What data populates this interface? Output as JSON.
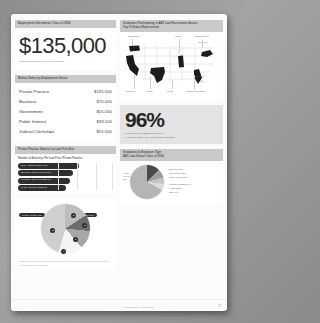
{
  "document": {
    "page_number": "17",
    "footer_text": "ABC Law School Annual Report"
  },
  "left_column": {
    "salary_panel": {
      "header": "Employment Information: Class of 2014",
      "big_figure": "$135,000",
      "big_figure_caption": "Median Starting Salary (Private Practice)"
    },
    "breakdown_panel": {
      "header": "Median Salary by Employment Sector",
      "rows": [
        {
          "label": "Private Practice",
          "value": "$135,000"
        },
        {
          "label": "Business",
          "value": "$70,000"
        },
        {
          "label": "Government",
          "value": "$55,000"
        },
        {
          "label": "Public Interest",
          "value": "$39,500"
        },
        {
          "label": "Judicial Clerkships",
          "value": "$55,000"
        }
      ]
    },
    "firm_size_panel": {
      "header": "Private Practice Salaries by Law Firm Size",
      "sub_caption": "Number of Attorneys Per Law Firm / Private Practice",
      "bars": [
        {
          "label": "501+ Attorneys  $160,000"
        },
        {
          "label": "251-500 Attorneys  $145,000"
        },
        {
          "label": "101-250 Attorneys  $125,000"
        },
        {
          "label": "2-100 Attorneys  $72,500"
        }
      ]
    },
    "pie_panel": {
      "legend": [
        {
          "label": "Private Practice  52%"
        },
        {
          "label": "Business  18%"
        },
        {
          "label": "Government  12%"
        }
      ],
      "slices": [
        {
          "name": "Private Practice",
          "value": 52,
          "marker": "52"
        },
        {
          "name": "Business",
          "value": 18,
          "marker": "18"
        },
        {
          "name": "Government",
          "value": 12,
          "marker": "12"
        },
        {
          "name": "Public Interest",
          "value": 11,
          "marker": "11"
        },
        {
          "name": "Clerkships",
          "value": 7,
          "marker": "7"
        }
      ],
      "footnote": "Employment status based on graduates reporting nine months after graduation. Percentages may not total 100% due to rounding."
    }
  },
  "right_column": {
    "map_panel": {
      "header_line1": "Graduates Participating in ABC Law Recruitment Across",
      "header_line2": "Top 10 States Represented",
      "callouts_top": [
        {
          "label": "Washington"
        },
        {
          "label": "Illinois"
        },
        {
          "label": "Massachusetts"
        },
        {
          "label": "New York"
        }
      ],
      "callouts_bottom": [
        {
          "label": "California"
        },
        {
          "label": "Arizona"
        },
        {
          "label": "Texas"
        },
        {
          "label": "District of Columbia"
        },
        {
          "label": "Georgia"
        },
        {
          "label": "Florida"
        }
      ]
    },
    "stat_panel": {
      "value": "96%",
      "caption_line1": "Percentage of Graduates Employed",
      "caption_line2": "or in further study, nine months after graduation"
    },
    "sector_pie_panel": {
      "header_line1": "Graduates by Employer Type",
      "header_line2": "ABC Law School Class of 2014",
      "side_label_line1": "Private",
      "side_label_line2": "Practice",
      "side_label_line3": "52%",
      "legend_group_1": [
        "Business  18%",
        "Government  12%",
        "Public Interest  11%"
      ],
      "legend_group_2": [
        "Judicial Clerkships  7%",
        "Academia  2%",
        "Other  1%"
      ]
    }
  },
  "colors": {
    "page_bg": "#fbfbfb",
    "header_bar": "#c9c9c9",
    "bar_dark": "#2f2f2f",
    "stat_box": "#e3e3e3",
    "map_fill": "#1c1c1c"
  }
}
